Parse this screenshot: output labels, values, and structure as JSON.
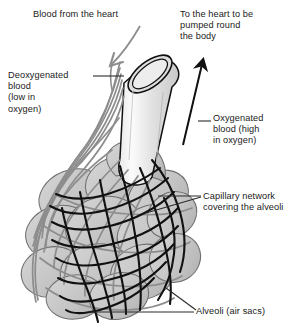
{
  "figure": {
    "colors": {
      "background": "#ffffff",
      "text": "#1a1a1a",
      "alveoli_fill": "#c6c6c6",
      "alveoli_stroke": "#6f6f6f",
      "tube_fill_light": "#f2f2f2",
      "tube_fill_dark": "#cfcfcf",
      "tube_stroke": "#111111",
      "deoxygenated_vessel": "#8d8d8d",
      "oxygenated_vessel": "#111111",
      "leader_line": "#2b2b2b"
    },
    "labels": {
      "blood_from_heart": "Blood from the heart",
      "to_heart": "To the heart to be\npumped round\nthe body",
      "deoxygenated": "Deoxygenated\nblood\n(low in\noxygen)",
      "oxygenated": "Oxygenated\nblood (high\nin oxygen)",
      "capillary": "Capillary network\ncovering the alveoli",
      "alveoli": "Alveoli (air sacs)"
    },
    "icon_names": {
      "incoming_arrow": "deoxygenated-blood-arrow-icon",
      "outgoing_arrow": "oxygenated-blood-arrow-icon",
      "bronchiole": "bronchiole-tube-icon",
      "alveoli_cluster": "alveoli-cluster-icon"
    }
  }
}
